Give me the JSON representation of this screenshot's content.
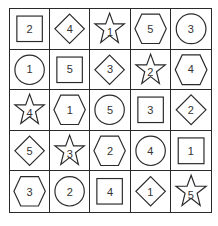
{
  "puzzle": {
    "rows": 5,
    "cols": 5,
    "cells": [
      [
        {
          "shape": "square",
          "value": "2"
        },
        {
          "shape": "diamond",
          "value": "4"
        },
        {
          "shape": "star",
          "value": "1"
        },
        {
          "shape": "hexagon",
          "value": "5"
        },
        {
          "shape": "circle",
          "value": "3"
        }
      ],
      [
        {
          "shape": "circle",
          "value": "1"
        },
        {
          "shape": "square",
          "value": "5"
        },
        {
          "shape": "diamond",
          "value": "3"
        },
        {
          "shape": "star",
          "value": "2"
        },
        {
          "shape": "hexagon",
          "value": "4"
        }
      ],
      [
        {
          "shape": "star",
          "value": "4"
        },
        {
          "shape": "hexagon",
          "value": "1"
        },
        {
          "shape": "circle",
          "value": "5"
        },
        {
          "shape": "square",
          "value": "3"
        },
        {
          "shape": "diamond",
          "value": "2"
        }
      ],
      [
        {
          "shape": "diamond",
          "value": "5"
        },
        {
          "shape": "star",
          "value": "3"
        },
        {
          "shape": "hexagon",
          "value": "2"
        },
        {
          "shape": "circle",
          "value": "4"
        },
        {
          "shape": "square",
          "value": "1"
        }
      ],
      [
        {
          "shape": "hexagon",
          "value": "3"
        },
        {
          "shape": "circle",
          "value": "2"
        },
        {
          "shape": "square",
          "value": "4"
        },
        {
          "shape": "diamond",
          "value": "1"
        },
        {
          "shape": "star",
          "value": "5"
        }
      ]
    ]
  },
  "colors": {
    "line": "#2a2a2a",
    "text": "#333333",
    "background": "#ffffff"
  }
}
